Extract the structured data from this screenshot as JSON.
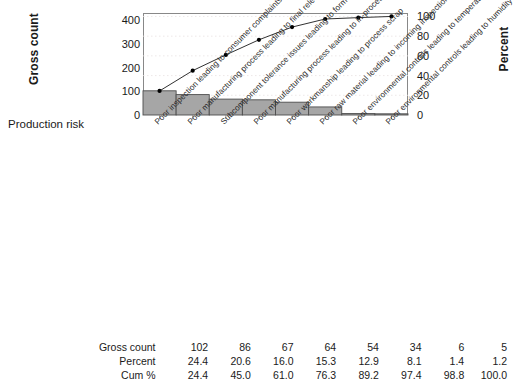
{
  "chart_data": {
    "type": "bar",
    "title": "",
    "subtitle": "",
    "xlabel": "Production risk",
    "ylabel": "Gross count",
    "y2label": "Percent",
    "grid": true,
    "legend": "none",
    "ylim": [
      0,
      430
    ],
    "y2lim": [
      0,
      103.5
    ],
    "yticks": [
      0,
      100,
      200,
      300,
      400
    ],
    "y2ticks": [
      0,
      20,
      40,
      60,
      80,
      100
    ],
    "categories": [
      "Poor inspection leading to consumer complaints",
      "Poor manufacturing process leading to final release inspection rejects",
      "Subcomponent tolerance issues leading to form and fit issues",
      "Poor manufacturing process leading to in-process inspection rejects",
      "Poor workmanship leading to process scrap",
      "Poor raw material leading to incoming inspection rejects",
      "Poor environmental controls leading to temperature excursions",
      "Poor environmental controls leading to humidity excursions"
    ],
    "series": [
      {
        "name": "Gross count",
        "type": "bar",
        "axis": "left",
        "values": [
          102,
          86,
          67,
          64,
          54,
          34,
          6,
          5
        ]
      },
      {
        "name": "Cum %",
        "type": "line",
        "axis": "right",
        "values": [
          24.4,
          45.0,
          61.0,
          76.3,
          89.2,
          97.4,
          98.8,
          100.0
        ]
      }
    ],
    "percent": [
      24.4,
      20.6,
      16.0,
      15.3,
      12.9,
      8.1,
      1.4,
      1.2
    ]
  },
  "axis": {
    "left_title": "Gross count",
    "right_title": "Percent",
    "x_title": "Production risk",
    "left_ticks": [
      "400",
      "300",
      "200",
      "100",
      "0"
    ],
    "right_ticks": [
      "100",
      "80",
      "60",
      "40",
      "20",
      "0"
    ]
  },
  "table": {
    "rows": [
      {
        "label": "Gross count",
        "values": [
          "102",
          "86",
          "67",
          "64",
          "54",
          "34",
          "6",
          "5"
        ]
      },
      {
        "label": "Percent",
        "values": [
          "24.4",
          "20.6",
          "16.0",
          "15.3",
          "12.9",
          "8.1",
          "1.4",
          "1.2"
        ]
      },
      {
        "label": "Cum %",
        "values": [
          "24.4",
          "45.0",
          "61.0",
          "76.3",
          "89.2",
          "97.4",
          "98.8",
          "100.0"
        ]
      }
    ]
  },
  "style": {
    "bar_fill": "#a6a6a6",
    "bar_stroke": "#4d4d4d",
    "line_color": "#1a1a1a",
    "marker_color": "#000000",
    "grid_color": "#e8e2e2",
    "frame_color": "#888888",
    "text_color": "#1a1a1a"
  }
}
